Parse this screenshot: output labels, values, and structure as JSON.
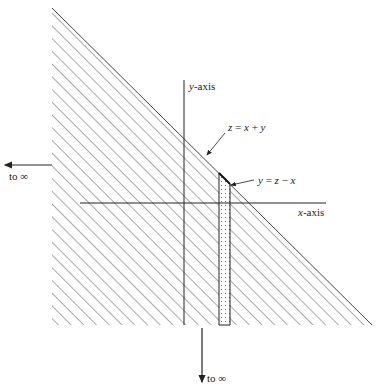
{
  "diagram": {
    "type": "region-of-integration",
    "labels": {
      "y_axis": {
        "var": "y",
        "suffix": "-axis"
      },
      "x_axis": {
        "var": "x",
        "suffix": "-axis"
      },
      "line_z": {
        "lhs": "z",
        "eq": " = ",
        "a": "x",
        "op": " + ",
        "b": "y"
      },
      "line_y": {
        "lhs": "y",
        "eq": " = ",
        "a": "z",
        "op": " − ",
        "b": "x"
      },
      "to_inf_left": "to ∞",
      "to_inf_down": "to ∞"
    },
    "colors": {
      "line": "#222222",
      "hatch": "#555555",
      "dots": "#666666",
      "background": "#ffffff"
    }
  }
}
